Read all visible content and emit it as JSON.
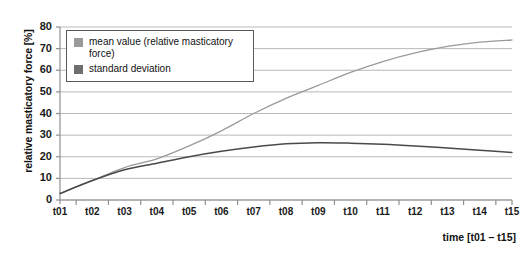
{
  "chart_data": {
    "type": "line",
    "title": "",
    "xlabel": "time [t01 – t15]",
    "ylabel": "relative masticatory force [%]",
    "categories": [
      "t01",
      "t02",
      "t03",
      "t04",
      "t05",
      "t06",
      "t07",
      "t08",
      "t09",
      "t10",
      "t11",
      "t12",
      "t13",
      "t14",
      "t15"
    ],
    "ylim": [
      0,
      80
    ],
    "yticks": [
      0,
      10,
      20,
      30,
      40,
      50,
      60,
      70,
      80
    ],
    "grid": true,
    "legend_position": "top-left-inside",
    "series": [
      {
        "name": "mean value (relative masticatory force)",
        "color": "#9a9a9a",
        "values": [
          3,
          9,
          15,
          19,
          25,
          32,
          40,
          47,
          53,
          59,
          64,
          68,
          71,
          73,
          74
        ]
      },
      {
        "name": "standard deviation",
        "color": "#4a4a4a",
        "values": [
          3,
          9,
          14,
          17,
          20,
          22.5,
          24.5,
          26,
          26.5,
          26.3,
          25.8,
          25,
          24,
          23,
          22
        ]
      }
    ]
  },
  "legend": {
    "items": [
      {
        "label": "mean value (relative masticatory force)",
        "swatch_color": "#9a9a9a"
      },
      {
        "label": "standard deviation",
        "swatch_color": "#6e6e6e"
      }
    ]
  },
  "axes": {
    "y_title": "relative masticatory force [%]",
    "x_title": "time [t01 – t15]"
  },
  "colors": {
    "grid": "#b8b8b8",
    "axis": "#8f8f8f",
    "mean_line": "#9a9a9a",
    "sd_line": "#4a4a4a",
    "text": "#111111"
  }
}
